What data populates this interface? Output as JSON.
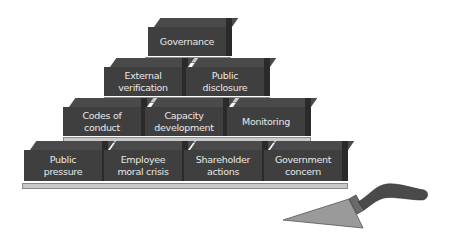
{
  "diagram": {
    "type": "brick-pyramid",
    "colors": {
      "brick_front": "#3f3f3f",
      "brick_top": "#4a4a4a",
      "brick_side": "#2a2a2a",
      "mortar": "#c9c9c9",
      "text": "#e8e8e8",
      "trowel_blade": "#9a9a9a",
      "trowel_handle": "#4a4a4a"
    },
    "rows": [
      {
        "level": 1,
        "bricks": [
          {
            "label": "Governance"
          }
        ]
      },
      {
        "level": 2,
        "bricks": [
          {
            "label": "External\nverification"
          },
          {
            "label": "Public\ndisclosure"
          }
        ]
      },
      {
        "level": 3,
        "bricks": [
          {
            "label": "Codes of\nconduct"
          },
          {
            "label": "Capacity\ndevelopment"
          },
          {
            "label": "Monitoring"
          }
        ]
      },
      {
        "level": 4,
        "bricks": [
          {
            "label": "Public\npressure"
          },
          {
            "label": "Employee\nmoral crisis"
          },
          {
            "label": "Shareholder\nactions"
          },
          {
            "label": "Government\nconcern"
          }
        ]
      }
    ],
    "decoration": "trowel-icon"
  }
}
